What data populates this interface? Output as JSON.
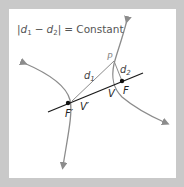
{
  "diagram": {
    "equation": {
      "bar_left": "|",
      "d1": "d",
      "d1_sub": "1",
      "minus": "−",
      "d2": "d",
      "d2_sub": "2",
      "bar_right": "|",
      "equals_constant": "= Constant"
    },
    "labels": {
      "P": "P",
      "d1": "d",
      "d1_sub": "1",
      "d2": "d",
      "d2_sub": "2",
      "F": "F",
      "F_prime": "F′",
      "V": "V",
      "V_prime": "V′"
    },
    "colors": {
      "background": "#c9c9c9",
      "panel": "#ffffff",
      "curve": "#8c8c8c",
      "axis": "#1a1a1a",
      "text": "#555555",
      "point_label": "#8c8c8c"
    },
    "points": {
      "F_prime": [
        68,
        103
      ],
      "F": [
        122,
        81
      ],
      "P": [
        114,
        61
      ],
      "V": [
        113,
        85
      ],
      "V_prime": [
        72,
        101
      ]
    }
  }
}
